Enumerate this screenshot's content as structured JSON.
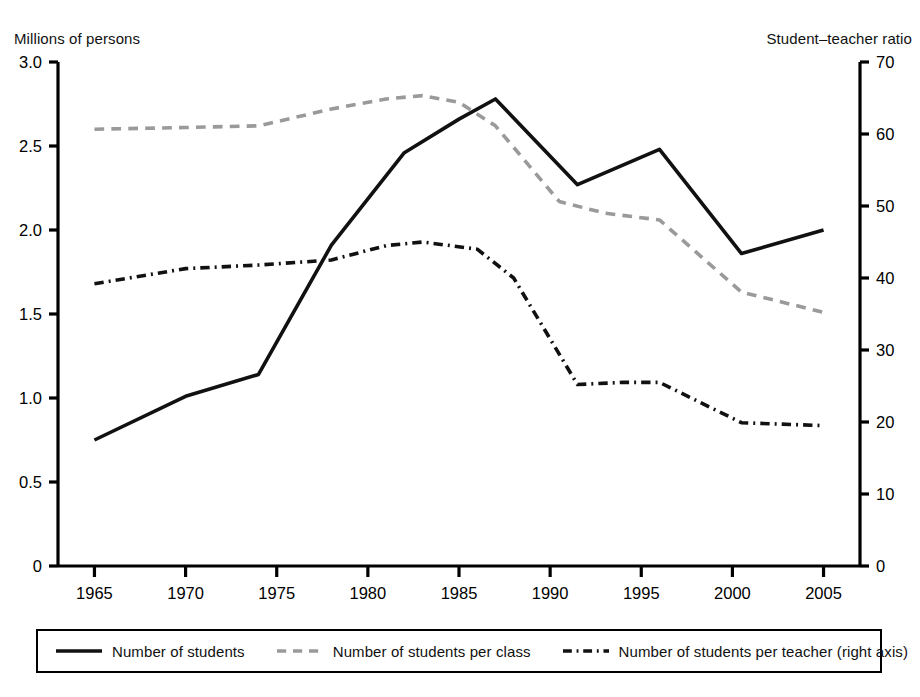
{
  "figure": {
    "left_axis_caption": "Millions of persons",
    "right_axis_caption": "Student–teacher ratio"
  },
  "legend": {
    "items": [
      {
        "label": "Number of students",
        "style": "solid",
        "color": "#111111"
      },
      {
        "label": "Number of students per class",
        "style": "dashed",
        "color": "#9a9a9a"
      },
      {
        "label": "Number of students per teacher (right axis)",
        "style": "dashdot",
        "color": "#111111"
      }
    ]
  },
  "chart_data": {
    "type": "line",
    "title": "",
    "xlabel": "",
    "ylabel": "Millions of persons",
    "y2label": "Student–teacher ratio",
    "grid": false,
    "legend_position": "bottom",
    "xlim": [
      1963,
      2007
    ],
    "ylim": [
      0,
      3.0
    ],
    "y2lim": [
      0,
      70
    ],
    "xticks": [
      1965,
      1970,
      1975,
      1980,
      1985,
      1990,
      1995,
      2000,
      2005
    ],
    "xtick_labels": [
      "1965",
      "1970",
      "1975",
      "1980",
      "1985",
      "1990",
      "1995",
      "2000",
      "2005"
    ],
    "yticks": [
      0,
      0.5,
      1.0,
      1.5,
      2.0,
      2.5,
      3.0
    ],
    "ytick_labels": [
      "0",
      "0.5",
      "1.0",
      "1.5",
      "2.0",
      "2.5",
      "3.0"
    ],
    "y2ticks": [
      0,
      10,
      20,
      30,
      40,
      50,
      60,
      70
    ],
    "y2tick_labels": [
      "0",
      "10",
      "20",
      "30",
      "40",
      "50",
      "60",
      "70"
    ],
    "series": [
      {
        "name": "Number of students",
        "axis": "left",
        "style": "solid",
        "color": "#111111",
        "x": [
          1965,
          1970,
          1974,
          1978,
          1982,
          1985,
          1987,
          1991.5,
          1996,
          2000.5,
          2005
        ],
        "values": [
          0.75,
          1.01,
          1.14,
          1.91,
          2.46,
          2.66,
          2.78,
          2.27,
          2.48,
          1.86,
          2.0
        ]
      },
      {
        "name": "Number of students per class",
        "axis": "left",
        "style": "dashed",
        "color": "#9a9a9a",
        "x": [
          1965,
          1970,
          1974,
          1978,
          1981,
          1983,
          1985,
          1987,
          1990.5,
          1993,
          1996,
          2000.5,
          2005
        ],
        "values": [
          2.6,
          2.61,
          2.62,
          2.72,
          2.78,
          2.8,
          2.76,
          2.62,
          2.17,
          2.1,
          2.06,
          1.63,
          1.51
        ]
      },
      {
        "name": "Number of students per teacher (right axis)",
        "axis": "right",
        "style": "dashdot",
        "color": "#111111",
        "x": [
          1965,
          1970,
          1974,
          1978,
          1981,
          1983,
          1986,
          1988,
          1991.5,
          1994,
          1996,
          2000.5,
          2005
        ],
        "values": [
          39.2,
          41.3,
          41.8,
          42.5,
          44.5,
          45.0,
          44.0,
          40.0,
          25.2,
          25.5,
          25.5,
          19.9,
          19.5
        ]
      }
    ]
  }
}
